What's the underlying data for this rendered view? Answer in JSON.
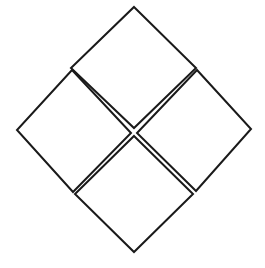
{
  "figure": {
    "name": "four-diamonds-rotated-squares",
    "canvas": {
      "width": 265,
      "height": 268,
      "background_color": "#ffffff"
    },
    "style": {
      "stroke_color": "#1a1a1a",
      "stroke_width": 2,
      "fill_color": "#ffffff"
    },
    "overall_bounds": {
      "top_vertex": [
        134,
        7
      ],
      "left_vertex": [
        17,
        130
      ],
      "right_vertex": [
        251,
        129
      ],
      "bottom_vertex": [
        134,
        252
      ]
    },
    "center_crossing": [
      134,
      131
    ],
    "shapes": [
      {
        "id": "diamond-top",
        "label": "Top diamond",
        "points": "134,7 196,68 134,128 71,68"
      },
      {
        "id": "diamond-left",
        "label": "Left diamond",
        "points": "72,70 131,133 73,192 17,130"
      },
      {
        "id": "diamond-right",
        "label": "Right diamond",
        "points": "197,70 251,129 196,191 137,133"
      },
      {
        "id": "diamond-bottom",
        "label": "Bottom diamond",
        "points": "134,136 193,194 134,252 75,194"
      }
    ]
  }
}
